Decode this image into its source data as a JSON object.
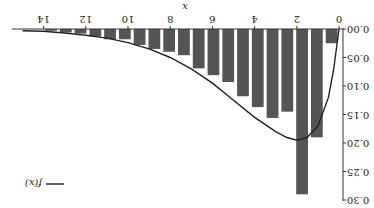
{
  "chart_data": {
    "type": "bar",
    "title": "",
    "xlabel": "x",
    "ylabel": "",
    "xlim": [
      0,
      15
    ],
    "ylim": [
      0,
      0.3
    ],
    "x_ticks": [
      0,
      2,
      4,
      6,
      8,
      10,
      12,
      14
    ],
    "y_ticks": [
      "0.00",
      "0.05",
      "0.10",
      "0.15",
      "0.20",
      "0.25",
      "0.30"
    ],
    "grid": false,
    "legend_position": "upper right",
    "orientation_note": "figure rendered rotated 180 degrees",
    "bar_color": "#555555",
    "series": [
      {
        "name": "histogram",
        "type": "bar",
        "bin_width": 0.7,
        "x": [
          0.35,
          1.05,
          1.75,
          2.45,
          3.15,
          3.85,
          4.55,
          5.25,
          5.95,
          6.65,
          7.35,
          8.05,
          8.75,
          9.45,
          10.15,
          10.85,
          11.55,
          12.25,
          12.95,
          13.65
        ],
        "values": [
          0.025,
          0.19,
          0.29,
          0.145,
          0.156,
          0.137,
          0.118,
          0.093,
          0.081,
          0.069,
          0.046,
          0.04,
          0.035,
          0.028,
          0.018,
          0.018,
          0.013,
          0.008,
          0.006,
          0.003
        ]
      },
      {
        "name": "f(x)",
        "type": "line",
        "color": "#222222",
        "x": [
          0,
          0.25,
          0.5,
          1,
          1.5,
          2,
          2.5,
          3,
          4,
          5,
          6,
          7,
          8,
          9,
          10,
          11,
          12,
          13,
          14,
          15
        ],
        "values": [
          0.0,
          0.07,
          0.12,
          0.17,
          0.19,
          0.195,
          0.19,
          0.18,
          0.155,
          0.125,
          0.095,
          0.07,
          0.05,
          0.035,
          0.024,
          0.016,
          0.011,
          0.007,
          0.004,
          0.003
        ]
      }
    ],
    "legend": [
      "f(x)"
    ]
  }
}
